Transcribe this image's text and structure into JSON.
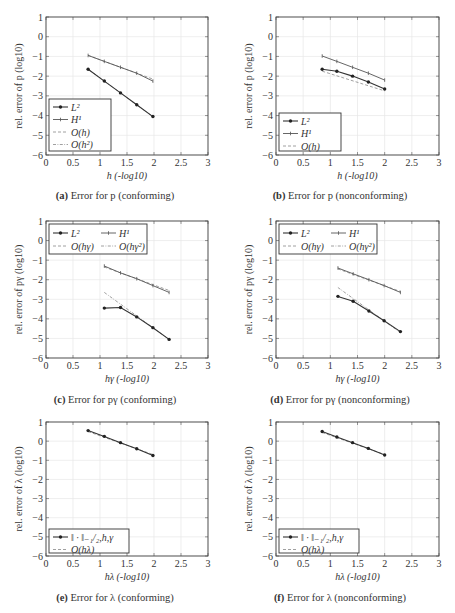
{
  "figure": {
    "panels": [
      {
        "id": "a",
        "label": "(a)",
        "caption": "Error for p (conforming)"
      },
      {
        "id": "b",
        "label": "(b)",
        "caption": "Error for p (nonconforming)"
      },
      {
        "id": "c",
        "label": "(c)",
        "caption": "Error for pγ (conforming)"
      },
      {
        "id": "d",
        "label": "(d)",
        "caption": "Error for pγ (nonconforming)"
      },
      {
        "id": "e",
        "label": "(e)",
        "caption": "Error for λ (conforming)"
      },
      {
        "id": "f",
        "label": "(f)",
        "caption": "Error for λ (nonconforming)"
      }
    ]
  },
  "chart_data": [
    {
      "id": "a",
      "type": "line",
      "title": "(a) Error for p (conforming)",
      "xlabel": "h (-log10)",
      "ylabel": "rel. error of p (log10)",
      "xlim": [
        0,
        3
      ],
      "ylim": [
        -6,
        1
      ],
      "xticks": [
        "0",
        "0.5",
        "1",
        "1.5",
        "2",
        "2.5",
        "3"
      ],
      "yticks": [
        "1",
        "0",
        "−1",
        "−2",
        "−3",
        "−4",
        "−5",
        "−6"
      ],
      "grid": true,
      "legend_position": "lower left",
      "legend_columns": 1,
      "series": [
        {
          "name": "L²",
          "style": "solid-marker",
          "x": [
            0.78,
            1.08,
            1.38,
            1.68,
            1.98
          ],
          "y": [
            -1.65,
            -2.25,
            -2.85,
            -3.45,
            -4.05
          ]
        },
        {
          "name": "H¹",
          "style": "solid-tick",
          "x": [
            0.78,
            1.08,
            1.38,
            1.68,
            1.98
          ],
          "y": [
            -0.95,
            -1.25,
            -1.55,
            -1.85,
            -2.25
          ]
        },
        {
          "name": "O(h)",
          "style": "dashed",
          "x": [
            0.78,
            1.98
          ],
          "y": [
            -0.95,
            -2.15
          ]
        },
        {
          "name": "O(h²)",
          "style": "dashdot",
          "x": [
            0.78,
            1.98
          ],
          "y": [
            -1.65,
            -4.05
          ]
        }
      ]
    },
    {
      "id": "b",
      "type": "line",
      "title": "(b) Error for p (nonconforming)",
      "xlabel": "h (-log10)",
      "ylabel": "rel. error of p (log10)",
      "xlim": [
        0,
        3
      ],
      "ylim": [
        -6,
        1
      ],
      "xticks": [
        "0",
        "0.5",
        "1",
        "1.5",
        "2",
        "2.5",
        "3"
      ],
      "yticks": [
        "1",
        "0",
        "−1",
        "−2",
        "−3",
        "−4",
        "−5",
        "−6"
      ],
      "grid": true,
      "legend_position": "lower left",
      "legend_columns": 1,
      "series": [
        {
          "name": "L²",
          "style": "solid-marker",
          "x": [
            0.85,
            1.12,
            1.41,
            1.7,
            2.0
          ],
          "y": [
            -1.65,
            -1.75,
            -2.0,
            -2.3,
            -2.65
          ]
        },
        {
          "name": "H¹",
          "style": "solid-tick",
          "x": [
            0.85,
            1.12,
            1.41,
            1.7,
            2.0
          ],
          "y": [
            -0.98,
            -1.25,
            -1.55,
            -1.85,
            -2.2
          ]
        },
        {
          "name": "O(h)",
          "style": "dashed",
          "x": [
            0.85,
            2.0
          ],
          "y": [
            -1.75,
            -2.75
          ]
        }
      ]
    },
    {
      "id": "c",
      "type": "line",
      "title": "(c) Error for pγ (conforming)",
      "xlabel": "hγ (-log10)",
      "ylabel": "rel. error of pγ (log10)",
      "xlim": [
        0,
        3
      ],
      "ylim": [
        -6,
        1
      ],
      "xticks": [
        "0",
        "0.5",
        "1",
        "1.5",
        "2",
        "2.5",
        "3"
      ],
      "yticks": [
        "1",
        "0",
        "−1",
        "−2",
        "−3",
        "−4",
        "−5",
        "−6"
      ],
      "grid": true,
      "legend_position": "upper left",
      "legend_columns": 2,
      "series": [
        {
          "name": "L²",
          "style": "solid-marker",
          "x": [
            1.08,
            1.38,
            1.68,
            1.98,
            2.28
          ],
          "y": [
            -3.45,
            -3.42,
            -3.9,
            -4.45,
            -5.05
          ]
        },
        {
          "name": "H¹",
          "style": "solid-tick",
          "x": [
            1.08,
            1.38,
            1.68,
            1.98,
            2.28
          ],
          "y": [
            -1.3,
            -1.65,
            -1.95,
            -2.3,
            -2.65
          ]
        },
        {
          "name": "O(hγ)",
          "style": "dashed",
          "x": [
            1.08,
            2.28
          ],
          "y": [
            -1.35,
            -2.55
          ]
        },
        {
          "name": "O(hγ²)",
          "style": "dashdot",
          "x": [
            1.08,
            2.28
          ],
          "y": [
            -2.65,
            -5.05
          ]
        }
      ]
    },
    {
      "id": "d",
      "type": "line",
      "title": "(d) Error for pγ (nonconforming)",
      "xlabel": "hγ (-log10)",
      "ylabel": "rel. error of pγ (log10)",
      "xlim": [
        0,
        3
      ],
      "ylim": [
        -6,
        1
      ],
      "xticks": [
        "0",
        "0.5",
        "1",
        "1.5",
        "2",
        "2.5",
        "3"
      ],
      "yticks": [
        "1",
        "0",
        "−1",
        "−2",
        "−3",
        "−4",
        "−5",
        "−6"
      ],
      "grid": true,
      "legend_position": "upper left",
      "legend_columns": 2,
      "series": [
        {
          "name": "L²",
          "style": "solid-marker",
          "x": [
            1.14,
            1.42,
            1.71,
            1.99,
            2.29
          ],
          "y": [
            -2.85,
            -3.1,
            -3.6,
            -4.1,
            -4.65
          ]
        },
        {
          "name": "H¹",
          "style": "solid-tick",
          "x": [
            1.14,
            1.42,
            1.71,
            1.99,
            2.29
          ],
          "y": [
            -1.4,
            -1.7,
            -2.0,
            -2.3,
            -2.65
          ]
        },
        {
          "name": "O(hγ)",
          "style": "dashed",
          "x": [
            1.14,
            2.29
          ],
          "y": [
            -1.45,
            -2.6
          ]
        },
        {
          "name": "O(hγ²)",
          "style": "dashdot",
          "x": [
            1.14,
            2.29
          ],
          "y": [
            -2.4,
            -4.7
          ]
        }
      ]
    },
    {
      "id": "e",
      "type": "line",
      "title": "(e) Error for λ (conforming)",
      "xlabel": "hλ (-log10)",
      "ylabel": "rel. error of λ (log10)",
      "xlim": [
        0,
        3
      ],
      "ylim": [
        -6,
        1
      ],
      "xticks": [
        "0",
        "0.5",
        "1",
        "1.5",
        "2",
        "2.5",
        "3"
      ],
      "yticks": [
        "1",
        "0",
        "−1",
        "−2",
        "−3",
        "−4",
        "−5",
        "−6"
      ],
      "grid": true,
      "legend_position": "lower left",
      "legend_columns": 1,
      "series": [
        {
          "name": "‖ · ‖₋₁/₂,h,γ",
          "style": "solid-marker",
          "x": [
            0.78,
            1.08,
            1.38,
            1.68,
            1.98
          ],
          "y": [
            0.55,
            0.25,
            -0.08,
            -0.4,
            -0.75
          ]
        },
        {
          "name": "O(hλ)",
          "style": "dashed",
          "x": [
            0.78,
            1.98
          ],
          "y": [
            0.5,
            -0.7
          ]
        }
      ]
    },
    {
      "id": "f",
      "type": "line",
      "title": "(f) Error for λ (nonconforming)",
      "xlabel": "hλ (-log10)",
      "ylabel": "rel. error of λ (log10)",
      "xlim": [
        0,
        3
      ],
      "ylim": [
        -6,
        1
      ],
      "xticks": [
        "0",
        "0.5",
        "1",
        "1.5",
        "2",
        "2.5",
        "3"
      ],
      "yticks": [
        "1",
        "0",
        "−1",
        "−2",
        "−3",
        "−4",
        "−5",
        "−6"
      ],
      "grid": true,
      "legend_position": "lower left",
      "legend_columns": 1,
      "series": [
        {
          "name": "‖ · ‖₋₁/₂,h,γ",
          "style": "solid-marker",
          "x": [
            0.85,
            1.12,
            1.41,
            1.7,
            2.0
          ],
          "y": [
            0.5,
            0.22,
            -0.08,
            -0.38,
            -0.72
          ]
        },
        {
          "name": "O(hλ)",
          "style": "dashed",
          "x": [
            0.85,
            2.0
          ],
          "y": [
            0.45,
            -0.7
          ]
        }
      ]
    }
  ]
}
